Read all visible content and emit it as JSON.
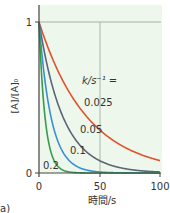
{
  "chart_data": {
    "type": "line",
    "title": "",
    "xlabel": "時間/s",
    "ylabel": "[A]/[A]₀",
    "xlim": [
      0,
      100
    ],
    "ylim": [
      0,
      1
    ],
    "x_ticks": [
      "0",
      "50",
      "100"
    ],
    "y_ticks": [
      "0",
      "1"
    ],
    "grid": {
      "vertical_at_x": 50,
      "horizontal_at_y": 1
    },
    "legend_title": "k/s⁻¹ =",
    "function": "[A]/[A]0 = exp(-k t)",
    "series": [
      {
        "name": "0.025",
        "k": 0.025,
        "color": "#e0522c",
        "x": [
          0,
          25,
          50,
          75,
          100
        ],
        "values": [
          1.0,
          0.535,
          0.287,
          0.153,
          0.082
        ]
      },
      {
        "name": "0.05",
        "k": 0.05,
        "color": "#5b6478",
        "x": [
          0,
          25,
          50,
          75,
          100
        ],
        "values": [
          1.0,
          0.287,
          0.082,
          0.024,
          0.007
        ]
      },
      {
        "name": "0.1",
        "k": 0.1,
        "color": "#3a8fd2",
        "x": [
          0,
          25,
          50,
          75,
          100
        ],
        "values": [
          1.0,
          0.082,
          0.007,
          0.001,
          0.0
        ]
      },
      {
        "name": "0.2",
        "k": 0.2,
        "color": "#3a9a4c",
        "x": [
          0,
          25,
          50,
          75,
          100
        ],
        "values": [
          1.0,
          0.007,
          0.0,
          0.0,
          0.0
        ]
      }
    ],
    "panel_label": "a)",
    "background": "#eef7ec"
  }
}
